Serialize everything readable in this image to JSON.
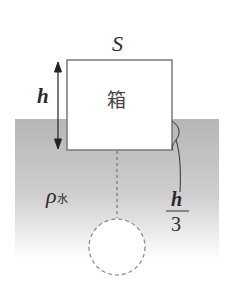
{
  "diagram": {
    "box": {
      "label": "箱",
      "top_label": "S"
    },
    "height_label": "h",
    "submerged_fraction": {
      "numerator": "h",
      "denominator": "3"
    },
    "fluid_density": {
      "symbol": "ρ",
      "subscript": "水"
    },
    "colors": {
      "water_top": "#b9b9b9",
      "water_bottom": "#ffffff",
      "outline": "#7a7a7a",
      "text": "#2a2a2a",
      "dashed": "#777777"
    }
  }
}
